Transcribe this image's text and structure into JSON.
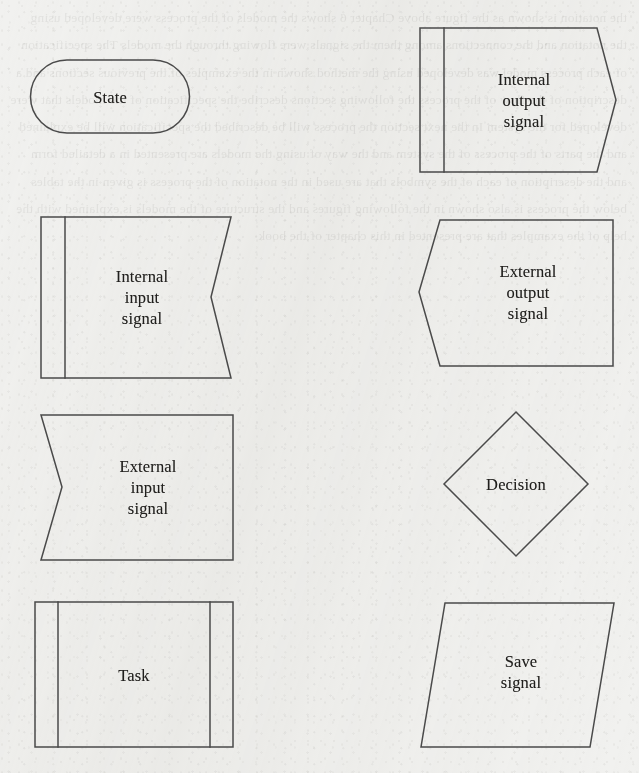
{
  "page": {
    "kind": "flowchart-symbol-legend",
    "width": 639,
    "height": 773,
    "background_color": "#f1f1ef",
    "stroke_color": "#4a4a4a",
    "text_color": "#201f1d",
    "background_ghost_text": "the notation is shown as the figure above Chapter 6 shows the models of the process were developed using the notation and the connections among them the signals were flowing through the models The specification of each process model was developed using the method shown in the examples of the previous sections and a description of the flow of the process the following sections describe the specification of the models that were developed for the system In the next section the process will be described the specification will be explained and the parts of the process of the system and the way of using the models are presented in a detailed form and the description of each of the symbols that are used in the notation of the process is given in the tables below the process is also shown in the following figures and the structure of the models is explained with the help of the examples that are presented in this chapter of the book"
  },
  "shapes": [
    {
      "id": "state",
      "label": "State",
      "symbol": "stadium",
      "label_center": {
        "x": 110,
        "y": 97
      }
    },
    {
      "id": "internal-output-signal",
      "label": "Internal\noutput\nsignal",
      "symbol": "barred-rect-point-right",
      "label_center": {
        "x": 524,
        "y": 100
      }
    },
    {
      "id": "internal-input-signal",
      "label": "Internal\ninput\nsignal",
      "symbol": "barred-rect-notch-right",
      "label_center": {
        "x": 142,
        "y": 297
      }
    },
    {
      "id": "external-output-signal",
      "label": "External\noutput\nsignal",
      "symbol": "rect-point-left",
      "label_center": {
        "x": 528,
        "y": 292
      }
    },
    {
      "id": "external-input-signal",
      "label": "External\ninput\nsignal",
      "symbol": "rect-notch-left",
      "label_center": {
        "x": 148,
        "y": 487
      }
    },
    {
      "id": "decision",
      "label": "Decision",
      "symbol": "diamond",
      "label_center": {
        "x": 516,
        "y": 484
      }
    },
    {
      "id": "task",
      "label": "Task",
      "symbol": "predefined-process",
      "label_center": {
        "x": 134,
        "y": 675
      }
    },
    {
      "id": "save-signal",
      "label": "Save\nsignal",
      "symbol": "parallelogram",
      "label_center": {
        "x": 521,
        "y": 672
      }
    }
  ]
}
